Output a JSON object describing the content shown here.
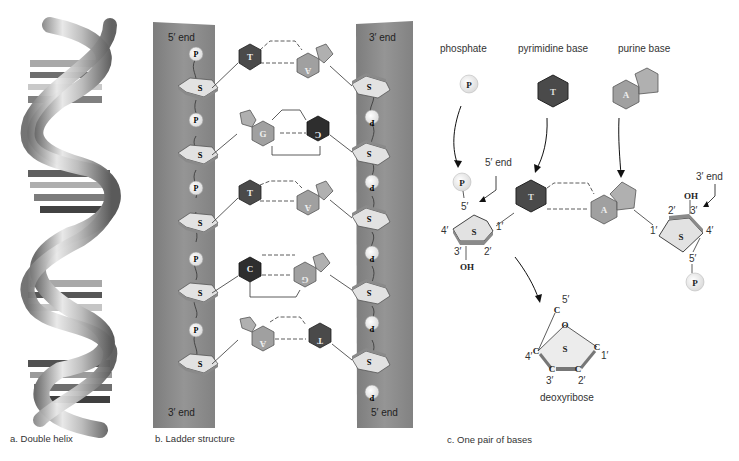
{
  "panels": {
    "a": {
      "caption": "a. Double helix"
    },
    "b": {
      "caption": "b. Ladder structure",
      "left_strand": {
        "top_label": "5′ end",
        "bottom_label": "3′ end"
      },
      "right_strand": {
        "top_label": "3′ end",
        "bottom_label": "5′ end"
      },
      "base_pairs": [
        {
          "left": "T",
          "right": "A"
        },
        {
          "left": "G",
          "right": "C"
        },
        {
          "left": "T",
          "right": "A"
        },
        {
          "left": "C",
          "right": "G"
        },
        {
          "left": "A",
          "right": "T"
        }
      ],
      "phosphate_label": "P",
      "sugar_label": "S"
    },
    "c": {
      "caption": "c. One pair of bases",
      "legend": {
        "phosphate": "phosphate",
        "pyrimidine": "pyrimidine base",
        "purine": "purine base"
      },
      "legend_symbols": {
        "phosphate": "P",
        "pyrimidine": "T",
        "purine": "A"
      },
      "left_end_label": "5′ end",
      "right_end_label": "3′ end",
      "left_nucleotide": {
        "base": "T",
        "sugar": "S",
        "phosphate": "P",
        "oh": "OH",
        "c5": "5′",
        "c4": "4′",
        "c3": "3′",
        "c2": "2′",
        "c1": "1′"
      },
      "right_nucleotide": {
        "base": "A",
        "sugar": "S",
        "phosphate": "P",
        "oh": "OH",
        "c5": "5′",
        "c4": "4′",
        "c3": "3′",
        "c2": "2′",
        "c1": "1′"
      },
      "deoxyribose": {
        "label": "deoxyribose",
        "ring_letter": "S",
        "oxygen": "O",
        "carbon": "C",
        "c5": "5′",
        "c4": "4′",
        "c3": "3′",
        "c2": "2′",
        "c1": "1′"
      }
    }
  },
  "colors": {
    "strand": "#8a8a8a",
    "pyrimidine": "#4a4a4a",
    "purine": "#9a9a9a",
    "sugar_fill": "#e6e6e6",
    "phosphate_fill": "#f2f2f2"
  }
}
